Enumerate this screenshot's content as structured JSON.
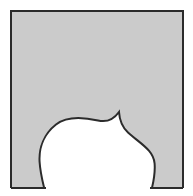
{
  "figure": {
    "type": "geometric-diagram",
    "canvas": {
      "width": 193,
      "height": 196,
      "background_color": "#FFFFFF"
    },
    "colors": {
      "background": "#FFFFFF",
      "fill_gray": "#CBCBCB",
      "outline": "#2B2B2B",
      "cutout_fill": "#FFFFFF"
    },
    "square": {
      "name": "outer-square",
      "left": 11,
      "top": 11,
      "right": 183,
      "bottom": 188,
      "width": 172,
      "height": 177,
      "stroke_width": 2,
      "stroke_color": "#2B2B2B",
      "fill_color": "#CBCBCB"
    },
    "cutout": {
      "name": "blob-cutout",
      "description": "White teardrop / balloon shaped region removed from the bottom-centre of the gray square, open at the bottom edge, with a sharp cusp on its upper-right.",
      "fill_color": "#FFFFFF",
      "stroke_width": 2,
      "stroke_color": "#2B2B2B",
      "bounds": {
        "left": 39,
        "top": 112,
        "right": 155,
        "bottom": 196
      },
      "cusp_point": {
        "x": 119,
        "y": 112
      },
      "bottom_left_intersection": {
        "x": 46,
        "y": 188
      },
      "bottom_right_intersection": {
        "x": 150,
        "y": 188
      },
      "path": "M 46 196 C 44 186 40.5 176 39.6 162 C 38.7 148 44 134 56 124.5 C 68 115 85 117.5 98 120.5 C 108 122.8 114 119 119 112 C 119.6 121 122 127 128 132.5 C 140 143.5 153.5 150 154.6 163.5 C 155.7 177 152 187 150 196 Z"
    },
    "bottom_edge_segments": [
      {
        "name": "bottom-edge-left",
        "x1": 11,
        "y1": 188,
        "x2": 46,
        "y2": 188
      },
      {
        "name": "bottom-edge-right",
        "x1": 150,
        "y1": 188,
        "x2": 183,
        "y2": 188
      }
    ]
  }
}
